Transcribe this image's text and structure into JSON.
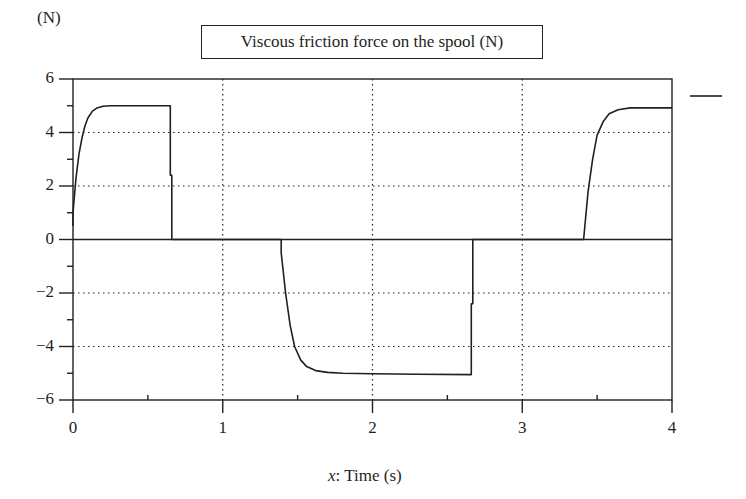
{
  "chart_data": {
    "type": "line",
    "title": "Viscous friction force on the spool (N)",
    "ylabel": "(N)",
    "xlabel": "x: Time (s)",
    "xlabel_var": "x",
    "xlabel_text": ": Time (s)",
    "xlim": [
      0,
      4
    ],
    "ylim": [
      -6,
      6
    ],
    "xticks": [
      0,
      1,
      2,
      3,
      4
    ],
    "xtick_labels": [
      "0",
      "1",
      "2",
      "3",
      "4"
    ],
    "yticks": [
      6,
      4,
      2,
      0,
      -2,
      -4,
      -6
    ],
    "ytick_labels": [
      "6",
      "4",
      "2",
      "0",
      "−2",
      "−4",
      "−6"
    ],
    "grid": "dotted",
    "legend": {
      "position": "right-top",
      "entries": [
        {
          "name": "",
          "style": "solid"
        }
      ]
    },
    "series": [
      {
        "name": "Viscous friction force",
        "x": [
          0.0,
          0.0,
          0.02,
          0.04,
          0.06,
          0.08,
          0.1,
          0.13,
          0.16,
          0.2,
          0.25,
          0.3,
          0.65,
          0.65,
          0.66,
          0.66,
          1.39,
          1.39,
          1.42,
          1.45,
          1.48,
          1.52,
          1.56,
          1.62,
          1.7,
          1.8,
          2.0,
          2.3,
          2.66,
          2.66,
          2.67,
          2.67,
          3.41,
          3.41,
          3.44,
          3.47,
          3.5,
          3.54,
          3.58,
          3.64,
          3.72,
          4.0
        ],
        "y": [
          0.5,
          1.0,
          2.3,
          3.2,
          3.8,
          4.25,
          4.55,
          4.8,
          4.92,
          4.98,
          5.0,
          5.0,
          5.0,
          2.4,
          2.4,
          0.0,
          0.0,
          -0.5,
          -2.0,
          -3.2,
          -4.0,
          -4.5,
          -4.75,
          -4.9,
          -4.97,
          -5.0,
          -5.02,
          -5.04,
          -5.05,
          -2.4,
          -2.4,
          0.0,
          0.0,
          -0.0,
          1.8,
          3.0,
          3.9,
          4.4,
          4.7,
          4.85,
          4.92,
          4.92
        ]
      }
    ]
  }
}
